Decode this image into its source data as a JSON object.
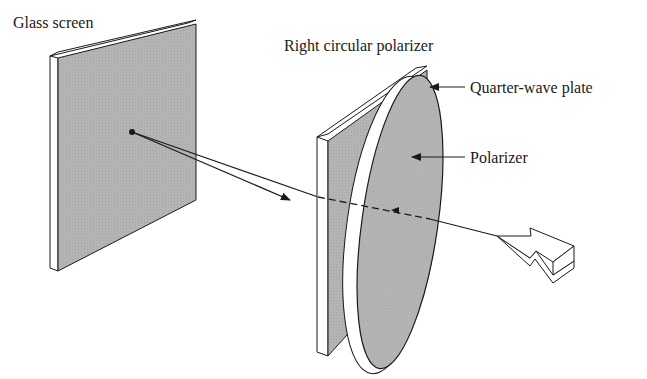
{
  "labels": {
    "glass_screen": "Glass screen",
    "right_circular_polarizer": "Right circular polarizer",
    "quarter_wave_plate": "Quarter-wave plate",
    "polarizer": "Polarizer"
  },
  "colors": {
    "plate_fill": "#b4b4b4",
    "edge_fill": "#ffffff",
    "line": "#1a1a1a",
    "background": "#ffffff"
  }
}
